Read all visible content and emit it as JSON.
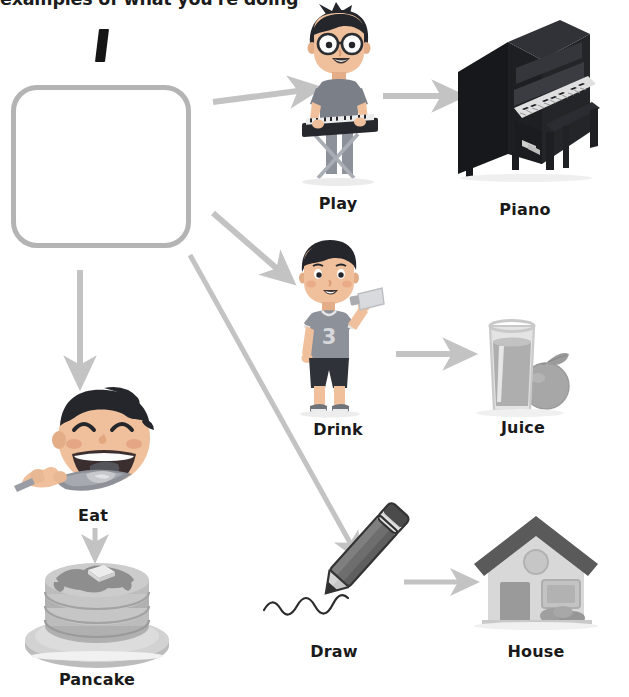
{
  "heading": {
    "text": "examples of what you're doing."
  },
  "prompt": {
    "letter": "I",
    "answer_box_placeholder": ""
  },
  "colors": {
    "arrow": "#c3c3c3",
    "box_border": "#b4b4b4",
    "label_text": "#1a1a1a",
    "skin": "#e9b58f",
    "skin_shadow": "#d79a73",
    "hair": "#24262b",
    "shirt_play": "#7b7f88",
    "shirt_drink": "#8d9199",
    "shorts_drink": "#2f3238",
    "piano_body": "#1e2024",
    "piano_keys": "#e8e8e8",
    "juice_glass": "#dcdcdc",
    "juice_liquid": "#a9a9a9",
    "orange": "#a0a0a0",
    "pancake_top": "#bdbdbd",
    "pancake_mid": "#a8a8a8",
    "plate": "#cfcfcf",
    "pencil_body": "#6e6e6e",
    "pencil_tip": "#b5b5b5",
    "house_wall": "#d8d8d8",
    "house_roof": "#5a5a5a",
    "house_door": "#9a9a9a",
    "house_window": "#b8b8b8"
  },
  "diagram": {
    "type": "mapping-exercise",
    "source_label": "answer-box",
    "rows": [
      {
        "verb": "Play",
        "verb_icon": "boy-playing-keyboard-icon",
        "object": "Piano",
        "object_icon": "upright-piano-icon"
      },
      {
        "verb": "Drink",
        "verb_icon": "boy-drinking-bottle-icon",
        "object": "Juice",
        "object_icon": "juice-glass-orange-icon"
      },
      {
        "verb": "Draw",
        "verb_icon": "pencil-drawing-line-icon",
        "object": "House",
        "object_icon": "house-icon"
      },
      {
        "verb": "Eat",
        "verb_icon": "face-eating-spoon-icon",
        "object": "Pancake",
        "object_icon": "pancake-stack-icon"
      }
    ]
  },
  "labels": {
    "play": "Play",
    "piano": "Piano",
    "drink": "Drink",
    "juice": "Juice",
    "draw": "Draw",
    "house": "House",
    "eat": "Eat",
    "pancake": "Pancake"
  },
  "jersey": {
    "number": "3"
  }
}
